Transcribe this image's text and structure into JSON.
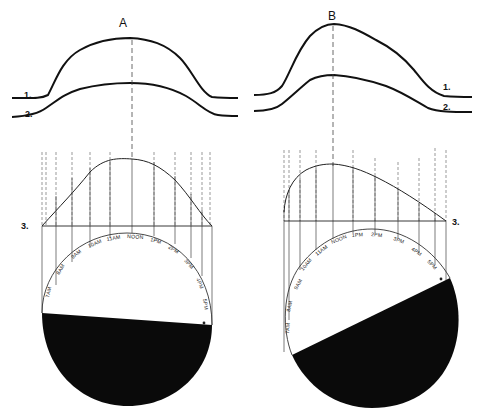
{
  "diagram": {
    "panels": [
      {
        "id": "A",
        "title": "A",
        "curve_labels": [
          "1.",
          "2."
        ],
        "projection_label": "3.",
        "dial_labels": [
          "7AM",
          "8AM",
          "9AM",
          "10AM",
          "11AM",
          "NOON",
          "1PM",
          "2PM",
          "3PM",
          "4PM",
          "5PM"
        ],
        "shade": "lower segment, nearly horizontal boundary"
      },
      {
        "id": "B",
        "title": "B",
        "curve_labels": [
          "1.",
          "2."
        ],
        "projection_label": "3.",
        "dial_labels": [
          "7AM",
          "8AM",
          "9AM",
          "10AM",
          "11AM",
          "NOON",
          "1PM",
          "2PM",
          "3PM",
          "4PM",
          "5PM"
        ],
        "shade": "lower segment, steeply tilted boundary"
      }
    ],
    "colors": {
      "ink": "#111111",
      "background": "#ffffff"
    }
  }
}
